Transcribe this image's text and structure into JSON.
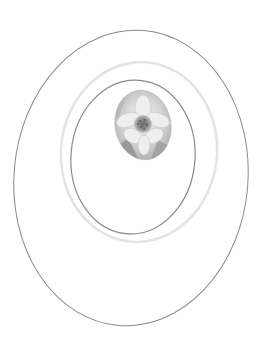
{
  "artwork": {
    "description": "Concentric tilted ellipses with a grayscale flower in an oval vignette",
    "background": "#ffffff",
    "rings": [
      {
        "id": "outer-ring",
        "cx": 131,
        "cy": 178,
        "rx": 117,
        "ry": 148,
        "rotate": 5,
        "stroke": "#8a8a8a",
        "width": 1
      },
      {
        "id": "light-ring",
        "cx": 139,
        "cy": 152,
        "rx": 78,
        "ry": 90,
        "rotate": 6,
        "stroke": "#e3e3e3",
        "width": 2.5
      },
      {
        "id": "inner-ring",
        "cx": 133,
        "cy": 157,
        "rx": 62,
        "ry": 77,
        "rotate": 5,
        "stroke": "#8a8a8a",
        "width": 1.2
      }
    ],
    "flower_oval": {
      "cx": 143,
      "cy": 125,
      "rx": 28,
      "ry": 35,
      "rotate": -10
    },
    "flower_label": "flower"
  }
}
